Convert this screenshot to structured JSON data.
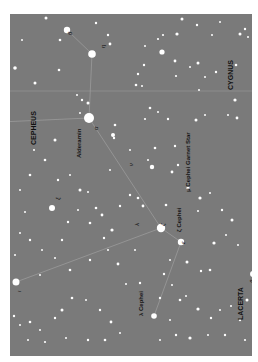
{
  "map": {
    "background": "#7a7a7a",
    "star_color": "#ffffff",
    "line_color": "#9a9a9a",
    "boundary_color": "#8c8c8c"
  },
  "constellations": [
    {
      "name": "CEPHEUS",
      "x": 30,
      "y": 145
    },
    {
      "name": "CYGNUS",
      "x": 227,
      "y": 90
    },
    {
      "name": "LACERTA",
      "x": 237,
      "y": 320
    }
  ],
  "named_stars": [
    {
      "name": "Alderamin",
      "x": 76,
      "y": 158
    },
    {
      "name": "μ Cephei  Garnet Star",
      "x": 185,
      "y": 192
    },
    {
      "name": "λ Cephei",
      "x": 138,
      "y": 316
    },
    {
      "name": "ζ Cephei",
      "x": 176,
      "y": 232
    }
  ],
  "greek_letters": [
    {
      "symbol": "α",
      "x": 93,
      "y": 130
    },
    {
      "symbol": "η",
      "x": 100,
      "y": 48
    },
    {
      "symbol": "θ",
      "x": 67,
      "y": 35
    },
    {
      "symbol": "ν",
      "x": 128,
      "y": 166
    },
    {
      "symbol": "ζ",
      "x": 160,
      "y": 226
    },
    {
      "symbol": "ε",
      "x": 180,
      "y": 244
    },
    {
      "symbol": "λ",
      "x": 134,
      "y": 226
    },
    {
      "symbol": "ι",
      "x": 16,
      "y": 292
    },
    {
      "symbol": "β",
      "x": 249,
      "y": 283
    },
    {
      "symbol": "ξ",
      "x": 55,
      "y": 200
    }
  ],
  "stars": [
    [
      67,
      30,
      3.2
    ],
    [
      92,
      54,
      3.8
    ],
    [
      89,
      118,
      5
    ],
    [
      161,
      228,
      4.2
    ],
    [
      181,
      242,
      3.2
    ],
    [
      154,
      316,
      2.8
    ],
    [
      16,
      282,
      3.5
    ],
    [
      253,
      274,
      3
    ],
    [
      52,
      208,
      3
    ],
    [
      46,
      18,
      1.5
    ],
    [
      96,
      23,
      1.2
    ],
    [
      108,
      35,
      1.2
    ],
    [
      110,
      44,
      1.4
    ],
    [
      60,
      40,
      1.3
    ],
    [
      15,
      68,
      1.8
    ],
    [
      22,
      40,
      1
    ],
    [
      59,
      70,
      1.3
    ],
    [
      35,
      83,
      1.5
    ],
    [
      77,
      95,
      1
    ],
    [
      82,
      100,
      1.2
    ],
    [
      88,
      103,
      1.5
    ],
    [
      115,
      125,
      1.3
    ],
    [
      80,
      113,
      1
    ],
    [
      130,
      150,
      1
    ],
    [
      162,
      52,
      2.6
    ],
    [
      182,
      19,
      1.5
    ],
    [
      197,
      25,
      1.2
    ],
    [
      158,
      39,
      1.1
    ],
    [
      163,
      35,
      1.1
    ],
    [
      177,
      34,
      1.6
    ],
    [
      145,
      46,
      1
    ],
    [
      144,
      65,
      1.2
    ],
    [
      175,
      61,
      1.4
    ],
    [
      198,
      63,
      1.5
    ],
    [
      199,
      90,
      1
    ],
    [
      205,
      77,
      1
    ],
    [
      216,
      72,
      1.2
    ],
    [
      236,
      65,
      1.3
    ],
    [
      235,
      100,
      1.6
    ],
    [
      240,
      34,
      1.5
    ],
    [
      245,
      29,
      1.2
    ],
    [
      248,
      37,
      1
    ],
    [
      220,
      22,
      1
    ],
    [
      212,
      35,
      1
    ],
    [
      138,
      74,
      1.2
    ],
    [
      142,
      86,
      1
    ],
    [
      136,
      85,
      1.3
    ],
    [
      176,
      76,
      1.1
    ],
    [
      190,
      67,
      1
    ],
    [
      150,
      108,
      1.3
    ],
    [
      168,
      119,
      1.2
    ],
    [
      158,
      112,
      1
    ],
    [
      196,
      120,
      1.5
    ],
    [
      205,
      115,
      1
    ],
    [
      228,
      115,
      1
    ],
    [
      237,
      118,
      1.4
    ],
    [
      113,
      135,
      2
    ],
    [
      114,
      138,
      1.2
    ],
    [
      145,
      119,
      1.1
    ],
    [
      138,
      198,
      1.3
    ],
    [
      152,
      167,
      2.2
    ],
    [
      172,
      172,
      1.4
    ],
    [
      155,
      148,
      1.3
    ],
    [
      175,
      146,
      1.2
    ],
    [
      178,
      165,
      1.2
    ],
    [
      188,
      188,
      1.6
    ],
    [
      148,
      160,
      1
    ],
    [
      130,
      195,
      1.2
    ],
    [
      110,
      170,
      1
    ],
    [
      143,
      206,
      1.4
    ],
    [
      166,
      205,
      1.3
    ],
    [
      198,
      211,
      1
    ],
    [
      200,
      198,
      1.6
    ],
    [
      210,
      193,
      1
    ],
    [
      222,
      210,
      1.2
    ],
    [
      232,
      220,
      1.5
    ],
    [
      238,
      245,
      1
    ],
    [
      226,
      235,
      1
    ],
    [
      214,
      243,
      1.6
    ],
    [
      210,
      270,
      1.3
    ],
    [
      201,
      271,
      1.2
    ],
    [
      187,
      262,
      1.5
    ],
    [
      170,
      260,
      1
    ],
    [
      164,
      274,
      1.2
    ],
    [
      160,
      298,
      1.2
    ],
    [
      170,
      320,
      1
    ],
    [
      55,
      140,
      1.5
    ],
    [
      45,
      160,
      1.3
    ],
    [
      34,
      150,
      1
    ],
    [
      58,
      180,
      1.2
    ],
    [
      70,
      175,
      1
    ],
    [
      80,
      190,
      1.5
    ],
    [
      88,
      192,
      1
    ],
    [
      96,
      208,
      1.3
    ],
    [
      102,
      215,
      1.4
    ],
    [
      120,
      206,
      1.2
    ],
    [
      112,
      230,
      1.6
    ],
    [
      104,
      238,
      1.2
    ],
    [
      90,
      223,
      1.3
    ],
    [
      78,
      210,
      1
    ],
    [
      68,
      222,
      1.2
    ],
    [
      62,
      240,
      1.2
    ],
    [
      55,
      258,
      1
    ],
    [
      42,
      250,
      1
    ],
    [
      30,
      240,
      1.2
    ],
    [
      20,
      233,
      1
    ],
    [
      25,
      212,
      1
    ],
    [
      20,
      190,
      1
    ],
    [
      30,
      175,
      1.3
    ],
    [
      15,
      255,
      1
    ],
    [
      40,
      275,
      1
    ],
    [
      70,
      270,
      1.3
    ],
    [
      90,
      260,
      1.2
    ],
    [
      108,
      250,
      1
    ],
    [
      118,
      264,
      1.4
    ],
    [
      135,
      250,
      1
    ],
    [
      140,
      283,
      1.2
    ],
    [
      126,
      284,
      1
    ],
    [
      14,
      316,
      1.2
    ],
    [
      20,
      325,
      1
    ],
    [
      30,
      322,
      1.3
    ],
    [
      40,
      330,
      1
    ],
    [
      55,
      318,
      1.2
    ],
    [
      62,
      310,
      1.5
    ],
    [
      72,
      298,
      1.3
    ],
    [
      86,
      300,
      1
    ],
    [
      100,
      310,
      1.2
    ],
    [
      111,
      322,
      1.4
    ],
    [
      120,
      333,
      1
    ],
    [
      105,
      340,
      1.3
    ],
    [
      88,
      340,
      1.2
    ],
    [
      66,
      338,
      1
    ],
    [
      45,
      342,
      1.1
    ],
    [
      28,
      340,
      1
    ],
    [
      172,
      285,
      1
    ],
    [
      180,
      300,
      1.3
    ],
    [
      186,
      296,
      1
    ],
    [
      198,
      309,
      1.6
    ],
    [
      211,
      318,
      1.2
    ],
    [
      220,
      310,
      1
    ],
    [
      231,
      306,
      1
    ],
    [
      240,
      320,
      1.2
    ],
    [
      247,
      300,
      1.5
    ],
    [
      225,
      335,
      1.2
    ],
    [
      208,
      335,
      1
    ],
    [
      190,
      338,
      1.6
    ],
    [
      176,
      335,
      1.2
    ],
    [
      160,
      340,
      1
    ],
    [
      245,
      340,
      1.1
    ]
  ],
  "asterism_lines": [
    [
      [
        67,
        30
      ],
      [
        92,
        54
      ]
    ],
    [
      [
        92,
        54
      ],
      [
        89,
        118
      ]
    ],
    [
      [
        89,
        118
      ],
      [
        161,
        228
      ]
    ],
    [
      [
        89,
        118
      ],
      [
        0,
        122
      ]
    ],
    [
      [
        161,
        228
      ],
      [
        181,
        242
      ]
    ],
    [
      [
        161,
        228
      ],
      [
        16,
        282
      ]
    ],
    [
      [
        181,
        242
      ],
      [
        154,
        316
      ]
    ]
  ],
  "boundary_lines": [
    [
      [
        0,
        77
      ],
      [
        242,
        77
      ]
    ]
  ]
}
